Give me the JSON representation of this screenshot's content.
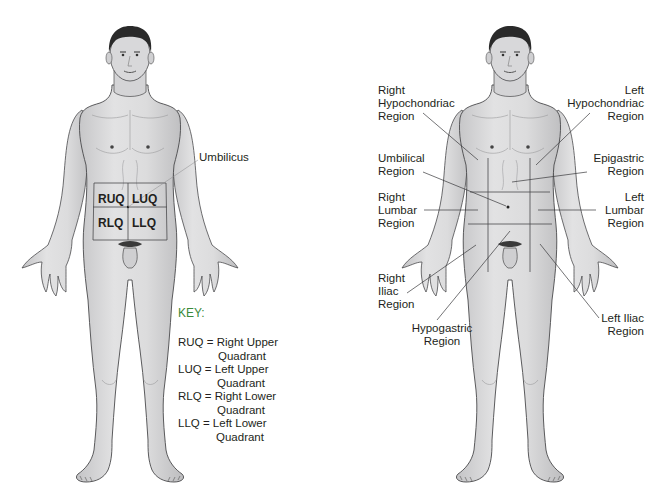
{
  "left_figure": {
    "title": "Abdominal quadrants",
    "umbilicus_label": "Umbilicus",
    "quadrants": [
      "RUQ",
      "LUQ",
      "RLQ",
      "LLQ"
    ],
    "key": {
      "title": "KEY:",
      "entries": [
        {
          "abbr": "RUQ =",
          "line1": "Right Upper",
          "line2": "Quadrant"
        },
        {
          "abbr": "LUQ =",
          "line1": "Left Upper",
          "line2": "Quadrant"
        },
        {
          "abbr": "RLQ =",
          "line1": "Right Lower",
          "line2": "Quadrant"
        },
        {
          "abbr": "LLQ =",
          "line1": "Left Lower",
          "line2": "Quadrant"
        }
      ]
    }
  },
  "right_figure": {
    "title": "Abdominal regions",
    "labels": {
      "right_hypochondriac": "Right\nHypochondriac\nRegion",
      "left_hypochondriac": "Left\nHypochondriac\nRegion",
      "umbilical": "Umbilical\nRegion",
      "epigastric": "Epigastric\nRegion",
      "right_lumbar": "Right\nLumbar\nRegion",
      "left_lumbar": "Left\nLumbar\nRegion",
      "right_iliac": "Right\nIliac\nRegion",
      "hypogastric": "Hypogastric\nRegion",
      "left_iliac": "Left Iliac\nRegion"
    }
  },
  "colors": {
    "skin": "#d9d9da",
    "skin_shade": "#b8b8ba",
    "outline": "#4a4a4c",
    "hair": "#2a2a2a",
    "key_title": "#3a8a3a",
    "text": "#231f20"
  }
}
